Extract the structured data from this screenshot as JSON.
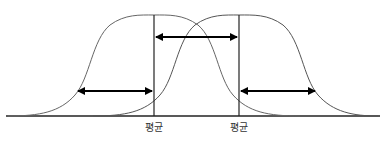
{
  "diagram": {
    "type": "two overlapping normal distributions",
    "baseline_y": 116,
    "curves": [
      {
        "name": "left-distribution",
        "mean_x": 154,
        "peak_y": 15,
        "color": "#555555"
      },
      {
        "name": "right-distribution",
        "mean_x": 239,
        "peak_y": 15,
        "color": "#555555"
      }
    ],
    "mean_lines": [
      {
        "x": 154,
        "label": "평균"
      },
      {
        "x": 239,
        "label": "평균"
      }
    ],
    "arrows": [
      {
        "name": "left-spread-arrow",
        "x1": 78,
        "x2": 153,
        "y": 91
      },
      {
        "name": "mean-difference-arrow",
        "x1": 155,
        "x2": 238,
        "y": 37
      },
      {
        "name": "right-spread-arrow",
        "x1": 241,
        "x2": 316,
        "y": 91
      }
    ]
  },
  "labels": {
    "left_mean": "평균",
    "right_mean": "평균"
  }
}
